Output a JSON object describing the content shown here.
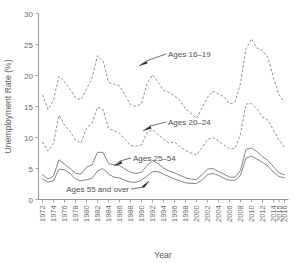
{
  "chart_data": {
    "type": "line",
    "title": "",
    "xlabel": "Year",
    "ylabel": "Unemployment Rate (%)",
    "xlim": [
      1972,
      2016
    ],
    "ylim": [
      0,
      30
    ],
    "grid": false,
    "legend_position": "inline-annotations",
    "ytick_labels": [
      "0",
      "5",
      "10",
      "15",
      "20",
      "25",
      "30"
    ],
    "ytick_values": [
      0,
      5,
      10,
      15,
      20,
      25,
      30
    ],
    "xtick_labels": [
      "1972",
      "1974",
      "1976",
      "1978",
      "1980",
      "1982",
      "1984",
      "1986",
      "1988",
      "1990",
      "1992",
      "1994",
      "1996",
      "1998",
      "2000",
      "2002",
      "2004",
      "2006",
      "2008",
      "2010",
      "2012",
      "2014",
      "2015",
      "2016"
    ],
    "xtick_values": [
      1972,
      1974,
      1976,
      1978,
      1980,
      1982,
      1984,
      1986,
      1988,
      1990,
      1992,
      1994,
      1996,
      1998,
      2000,
      2002,
      2004,
      2006,
      2008,
      2010,
      2012,
      2014,
      2015,
      2016
    ],
    "x": [
      1972,
      1973,
      1974,
      1975,
      1976,
      1977,
      1978,
      1979,
      1980,
      1981,
      1982,
      1983,
      1984,
      1985,
      1986,
      1987,
      1988,
      1989,
      1990,
      1991,
      1992,
      1993,
      1994,
      1995,
      1996,
      1997,
      1998,
      1999,
      2000,
      2001,
      2002,
      2003,
      2004,
      2005,
      2006,
      2007,
      2008,
      2009,
      2010,
      2011,
      2012,
      2013,
      2014,
      2015,
      2016
    ],
    "series": [
      {
        "name": "Ages 16–19",
        "style": "dashed",
        "color": "#8a8a8a",
        "label_text": "Ages 16–19",
        "values": [
          16.9,
          14.5,
          16.0,
          19.9,
          19.0,
          17.8,
          16.4,
          16.1,
          17.8,
          19.6,
          23.2,
          22.4,
          18.9,
          18.6,
          18.3,
          16.9,
          15.3,
          15.0,
          15.5,
          18.7,
          20.1,
          19.0,
          17.6,
          17.3,
          16.7,
          16.0,
          14.6,
          13.9,
          13.1,
          14.7,
          16.5,
          17.5,
          17.0,
          16.6,
          15.4,
          15.7,
          18.7,
          24.3,
          25.9,
          24.4,
          24.0,
          22.9,
          19.6,
          16.9,
          15.7
        ]
      },
      {
        "name": "Ages 20–24",
        "style": "dashed",
        "color": "#8a8a8a",
        "label_text": "Ages 20–24",
        "values": [
          9.3,
          7.8,
          9.1,
          13.6,
          12.0,
          11.0,
          9.6,
          9.1,
          11.5,
          12.3,
          14.9,
          14.5,
          11.5,
          11.1,
          10.7,
          9.7,
          8.7,
          8.6,
          8.8,
          10.8,
          11.3,
          10.5,
          9.7,
          9.1,
          9.3,
          8.5,
          7.9,
          7.5,
          7.2,
          8.3,
          9.7,
          10.0,
          9.4,
          8.8,
          8.2,
          8.2,
          10.6,
          15.4,
          15.5,
          14.6,
          13.3,
          12.8,
          11.2,
          9.6,
          8.4
        ]
      },
      {
        "name": "Ages 25–54",
        "style": "solid",
        "color": "#7d7d7d",
        "label_text": "Ages 25–54",
        "values": [
          4.0,
          3.3,
          3.8,
          6.4,
          5.7,
          5.0,
          4.2,
          4.1,
          5.2,
          5.6,
          7.6,
          7.6,
          5.8,
          5.6,
          5.5,
          4.9,
          4.4,
          4.2,
          4.4,
          5.5,
          6.3,
          5.8,
          5.1,
          4.6,
          4.3,
          3.9,
          3.5,
          3.3,
          3.2,
          4.0,
          4.9,
          5.0,
          4.5,
          4.1,
          3.6,
          3.6,
          4.7,
          8.1,
          8.3,
          7.7,
          6.9,
          6.3,
          5.3,
          4.3,
          4.0
        ]
      },
      {
        "name": "Ages 55 and over",
        "style": "solid",
        "color": "#7d7d7d",
        "label_text": "Ages 55 and over",
        "values": [
          3.3,
          2.8,
          3.0,
          4.9,
          4.8,
          4.2,
          3.3,
          3.0,
          3.2,
          3.4,
          4.6,
          5.0,
          4.1,
          3.6,
          3.5,
          3.1,
          2.8,
          2.8,
          3.1,
          3.8,
          4.5,
          4.5,
          4.1,
          3.7,
          3.3,
          3.0,
          2.7,
          2.6,
          2.6,
          3.1,
          4.0,
          4.2,
          3.9,
          3.4,
          3.1,
          3.1,
          3.9,
          6.7,
          7.0,
          6.5,
          6.0,
          5.4,
          4.4,
          3.7,
          3.5
        ]
      }
    ],
    "annotations": [
      {
        "text": "Ages 16–19",
        "points_to_year": 1988,
        "points_to_value": 18.6
      },
      {
        "text": "Ages 20–24",
        "points_to_year": 1989,
        "points_to_value": 10.4
      },
      {
        "text": "Ages 25–54",
        "points_to_year": 1991,
        "points_to_value": 6.2
      },
      {
        "text": "Ages 55 and over",
        "points_to_year": 1995,
        "points_to_value": 3.8
      }
    ]
  }
}
